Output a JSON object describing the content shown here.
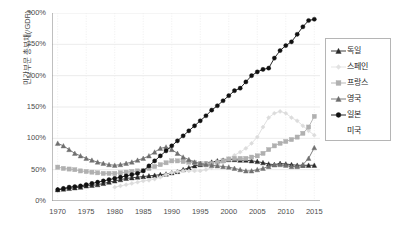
{
  "chart_data": {
    "type": "line",
    "title": "",
    "xlabel": "",
    "ylabel": "민간부문 총부채(/GDP)",
    "xlim": [
      1969,
      2016
    ],
    "ylim": [
      0,
      300
    ],
    "grid": true,
    "legend_position": "right",
    "y_unit": "%",
    "yticks": [
      "0%",
      "50%",
      "100%",
      "150%",
      "200%",
      "250%",
      "300%"
    ],
    "ytick_values": [
      0,
      50,
      100,
      150,
      200,
      250,
      300
    ],
    "xticks": [
      "1970",
      "1975",
      "1980",
      "1985",
      "1990",
      "1995",
      "2000",
      "2005",
      "2010",
      "2015"
    ],
    "xtick_values": [
      1970,
      1975,
      1980,
      1985,
      1990,
      1995,
      2000,
      2005,
      2010,
      2015
    ],
    "x": [
      1970,
      1971,
      1972,
      1973,
      1974,
      1975,
      1976,
      1977,
      1978,
      1979,
      1980,
      1981,
      1982,
      1983,
      1984,
      1985,
      1986,
      1987,
      1988,
      1989,
      1990,
      1991,
      1992,
      1993,
      1994,
      1995,
      1996,
      1997,
      1998,
      1999,
      2000,
      2001,
      2002,
      2003,
      2004,
      2005,
      2006,
      2007,
      2008,
      2009,
      2010,
      2011,
      2012,
      2013,
      2014,
      2015
    ],
    "series": [
      {
        "name": "독일",
        "marker": "triangle",
        "color": "#2b2b2b",
        "values": [
          18,
          19,
          20,
          21,
          22,
          24,
          25,
          26,
          28,
          30,
          32,
          34,
          36,
          37,
          38,
          39,
          40,
          41,
          42,
          43,
          45,
          47,
          50,
          53,
          56,
          58,
          60,
          62,
          64,
          65,
          66,
          66,
          65,
          65,
          64,
          63,
          61,
          59,
          58,
          60,
          59,
          58,
          57,
          57,
          57,
          57
        ]
      },
      {
        "name": "스페인",
        "marker": "diamond",
        "color": "#dcdcdc",
        "values": [
          null,
          null,
          null,
          null,
          null,
          null,
          null,
          null,
          null,
          null,
          22,
          24,
          26,
          28,
          30,
          32,
          33,
          35,
          38,
          42,
          45,
          47,
          48,
          48,
          48,
          48,
          50,
          53,
          57,
          62,
          68,
          73,
          78,
          84,
          92,
          102,
          118,
          133,
          140,
          143,
          140,
          133,
          128,
          120,
          112,
          105
        ]
      },
      {
        "name": "프랑스",
        "marker": "square",
        "color": "#b0b0b0",
        "values": [
          54,
          52,
          51,
          50,
          48,
          47,
          46,
          45,
          44,
          44,
          44,
          45,
          46,
          47,
          48,
          49,
          52,
          55,
          58,
          61,
          64,
          64,
          63,
          62,
          61,
          60,
          60,
          60,
          62,
          64,
          67,
          68,
          68,
          68,
          70,
          72,
          76,
          82,
          88,
          92,
          95,
          98,
          102,
          108,
          118,
          135
        ]
      },
      {
        "name": "영국",
        "marker": "triangle-up",
        "color": "#707070",
        "values": [
          92,
          88,
          82,
          76,
          72,
          68,
          65,
          62,
          60,
          58,
          57,
          58,
          60,
          62,
          65,
          68,
          72,
          78,
          84,
          86,
          82,
          76,
          70,
          66,
          62,
          60,
          58,
          57,
          56,
          55,
          54,
          52,
          50,
          48,
          48,
          50,
          52,
          55,
          58,
          58,
          57,
          55,
          55,
          58,
          68,
          85
        ]
      },
      {
        "name": "일본",
        "marker": "circle",
        "color": "#111111",
        "values": [
          18,
          20,
          22,
          23,
          24,
          26,
          28,
          30,
          32,
          34,
          36,
          38,
          40,
          42,
          44,
          48,
          56,
          64,
          72,
          80,
          88,
          96,
          104,
          112,
          120,
          128,
          136,
          145,
          152,
          160,
          168,
          176,
          180,
          190,
          200,
          206,
          210,
          212,
          228,
          240,
          248,
          254,
          266,
          278,
          288,
          290
        ]
      },
      {
        "name": "미국",
        "marker": "none",
        "color": "#bfbfbf",
        "values": [
          null,
          null,
          null,
          null,
          null,
          null,
          null,
          null,
          null,
          null,
          null,
          null,
          null,
          null,
          null,
          null,
          null,
          null,
          null,
          null,
          null,
          null,
          null,
          null,
          null,
          null,
          null,
          null,
          null,
          null,
          null,
          null,
          null,
          null,
          null,
          null,
          null,
          null,
          null,
          null,
          null,
          null,
          null,
          null,
          null,
          null
        ]
      }
    ],
    "legend_entries": [
      {
        "label": "독일",
        "marker": "triangle-line",
        "color": "#2b2b2b"
      },
      {
        "label": "스페인",
        "marker": "diamond-faint",
        "color": "#e2e2e2"
      },
      {
        "label": "프랑스",
        "marker": "square-line",
        "color": "#b0b0b0"
      },
      {
        "label": "영국",
        "marker": "triangle-line",
        "color": "#6e6e6e"
      },
      {
        "label": "일본",
        "marker": "circle-line",
        "color": "#111111"
      },
      {
        "label": "미국",
        "marker": "none",
        "color": "#ffffff"
      }
    ]
  }
}
